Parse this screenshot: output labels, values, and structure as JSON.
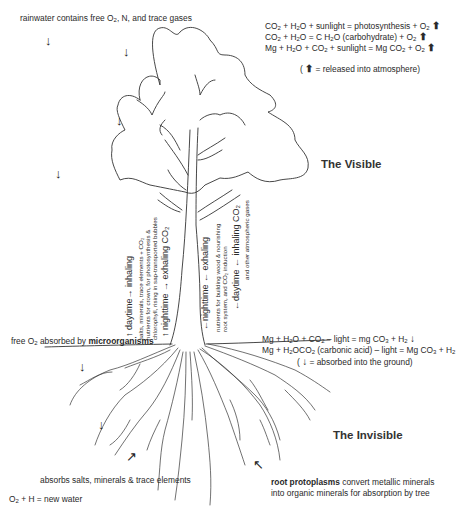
{
  "top": {
    "rain_label": "rainwater contains free O",
    "rain_label_sub": "2",
    "rain_label_tail": ", N, and trace gases"
  },
  "equations_above": [
    {
      "a": "CO",
      "a_sub": "2",
      "b": " + H",
      "b_sub": "2",
      "c": "O + sunlight = photosynthesis + O",
      "c_sub": "2"
    },
    {
      "a": "CO",
      "a_sub": "2",
      "b": " + H",
      "b_sub": "2",
      "c": "O = C H",
      "c_sub": "2",
      "d": "O (carbohydrate) + O",
      "d_sub": "2"
    },
    {
      "a": "Mg + H",
      "a_sub": "2",
      "b": "O + CO",
      "b_sub": "2",
      "c": " + sunlight = Mg CO",
      "c_sub": "2",
      "d": " + O",
      "d_sub": "2"
    }
  ],
  "legend_above": {
    "open": "(",
    "text": " = released into atmosphere)"
  },
  "section_titles": {
    "visible": "The Visible",
    "invisible": "The Invisible"
  },
  "trunk_left": {
    "line1": "↑  daytime→  inhaling",
    "line2a": "salts, minerals, trace elements + CO₂",
    "line2b": "nutrients for crown, for photosynthesis &",
    "line2c": "chlorophyll, rising in sap-transported bubbles",
    "line3": "↑  nighttime →  exhaling CO₂"
  },
  "trunk_right": {
    "line1": "←nighttime  ←  exhaling",
    "line2a": "nutrients for building wood & nourishing",
    "line2b": "root system, and CO₂ induction",
    "line3": "←daytime  ←  inhaling CO₂",
    "line3b": "and other atmospheric gases"
  },
  "ground": {
    "micro_pre": "free O",
    "micro_sub": "2",
    "micro_mid": " absorbed by ",
    "micro_bold": "microorganisms"
  },
  "equations_below": [
    {
      "a": "Mg + H",
      "a_sub": "2",
      "b": "O + CO",
      "b_sub": "2",
      "c": " – light = mg CO",
      "c_sub": "3",
      "d": " + H",
      "d_sub": "2"
    },
    {
      "a": "Mg + H",
      "a_sub": "2",
      "b": "OCO",
      "b_sub": "2",
      "c": " (carbonic acid) – light = Mg CO",
      "c_sub": "3",
      "d": " + H",
      "d_sub": "2"
    }
  ],
  "legend_below": {
    "open": "(",
    "text": " = absorbed into the ground)"
  },
  "roots": {
    "absorbs": "absorbs salts, minerals & trace elements",
    "water_pre": "O",
    "water_sub": "2",
    "water_tail": "  + H = new water",
    "proto_bold": "root protoplasms",
    "proto_tail": " convert metallic minerals",
    "proto_line2": "into organic minerals for absorption by tree"
  },
  "icons": {
    "down": "↓",
    "up": "↑",
    "up_bold": "⬆",
    "diag_up_right": "↗",
    "diag_up_left": "↖"
  }
}
